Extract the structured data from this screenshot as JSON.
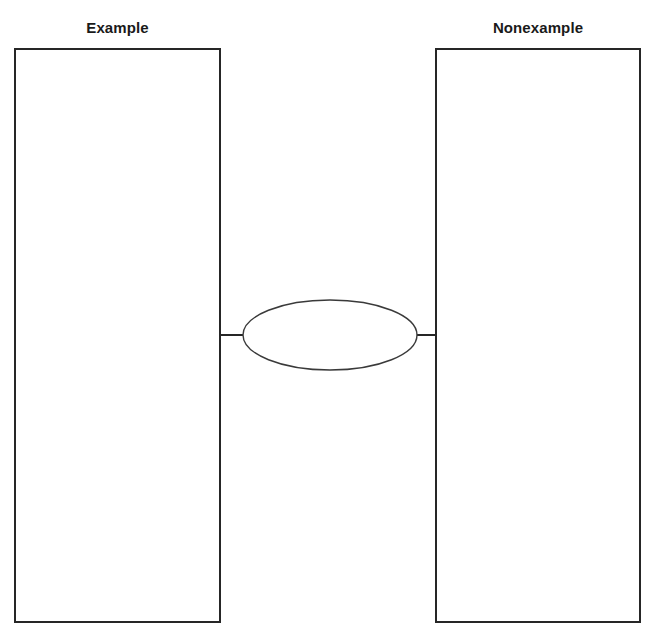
{
  "page": {
    "background_color": "#ffffff",
    "width": 647,
    "height": 642
  },
  "diagram": {
    "type": "example-nonexample-graphic-organizer",
    "line_color": "#262626",
    "ellipse_stroke_color": "#3a3a3a",
    "text_color": "#1a1a1a"
  },
  "columns": {
    "example": {
      "title": "Example",
      "box_text": ""
    },
    "nonexample": {
      "title": "Nonexample",
      "box_text": ""
    }
  },
  "center": {
    "shape": "ellipse",
    "label": ""
  },
  "connectors": {
    "left": {
      "name": "left-connector-line"
    },
    "right": {
      "name": "right-connector-line"
    }
  }
}
